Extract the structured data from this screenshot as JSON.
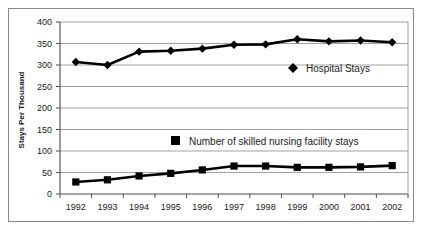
{
  "chart_data": {
    "type": "line",
    "title": "",
    "xlabel": "",
    "ylabel": "Stays Per Thousand",
    "categories": [
      "1992",
      "1993",
      "1994",
      "1995",
      "1996",
      "1997",
      "1998",
      "1999",
      "2000",
      "2001",
      "2002"
    ],
    "ylim": [
      0,
      400
    ],
    "yticks": [
      0,
      50,
      100,
      150,
      200,
      250,
      300,
      350,
      400
    ],
    "ytick_labels": [
      "0",
      "50",
      "100",
      "150",
      "200",
      "250",
      "300",
      "350",
      "400"
    ],
    "grid": true,
    "grid_axis": "y",
    "legend_position": "inside-plot",
    "series": [
      {
        "name": "Hospital Stays",
        "marker": "diamond",
        "color": "#000000",
        "values": [
          307,
          300,
          331,
          333,
          338,
          347,
          348,
          360,
          355,
          357,
          353
        ]
      },
      {
        "name": "Number of skilled nursing facility stays",
        "marker": "square",
        "color": "#000000",
        "values": [
          28,
          33,
          42,
          48,
          56,
          65,
          65,
          62,
          62,
          63,
          66
        ]
      }
    ],
    "annotations": []
  },
  "legend": {
    "hospital_stays": {
      "label": "Hospital Stays",
      "marker": "diamond"
    },
    "snf_stays": {
      "label": "Number of skilled nursing facility stays",
      "marker": "square"
    }
  },
  "colors": {
    "series": "#000000",
    "grid": "#8a8a8a",
    "axis": "#4d4d4d",
    "frame": "#8a8a8a",
    "background": "#ffffff",
    "text": "#1a1a1a"
  }
}
